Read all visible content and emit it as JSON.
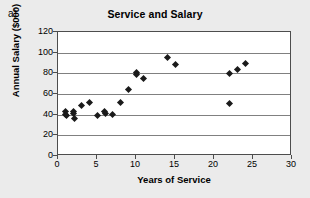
{
  "figure": {
    "panel_label": "a)",
    "background_color": "#ebebeb",
    "plot_background_color": "#ffffff",
    "axis_color": "#4d4d4d",
    "grid_color": "#808080",
    "marker_color": "#1a1a1a"
  },
  "chart_data": {
    "type": "scatter",
    "title": "Service and Salary",
    "xlabel": "Years of Service",
    "ylabel": "Annual Salary ($000)",
    "xlim": [
      0,
      30
    ],
    "ylim": [
      0,
      120
    ],
    "xticks": [
      0,
      5,
      10,
      15,
      20,
      25,
      30
    ],
    "yticks": [
      0,
      20,
      40,
      60,
      80,
      100,
      120
    ],
    "xtick_labels": [
      "0",
      "5",
      "10",
      "15",
      "20",
      "25",
      "30"
    ],
    "ytick_labels": [
      "0",
      "20",
      "40",
      "60",
      "80",
      "100",
      "120"
    ],
    "grid": "horizontal",
    "legend": null,
    "marker": "diamond",
    "points": [
      {
        "x": 1.0,
        "y": 43
      },
      {
        "x": 1.0,
        "y": 40
      },
      {
        "x": 1.1,
        "y": 39
      },
      {
        "x": 2.0,
        "y": 43
      },
      {
        "x": 2.0,
        "y": 41
      },
      {
        "x": 2.1,
        "y": 36
      },
      {
        "x": 3.0,
        "y": 49
      },
      {
        "x": 4.0,
        "y": 52
      },
      {
        "x": 5.0,
        "y": 39
      },
      {
        "x": 6.0,
        "y": 43
      },
      {
        "x": 6.1,
        "y": 41
      },
      {
        "x": 7.0,
        "y": 40
      },
      {
        "x": 8.0,
        "y": 52
      },
      {
        "x": 9.0,
        "y": 64
      },
      {
        "x": 10.0,
        "y": 81
      },
      {
        "x": 10.0,
        "y": 79
      },
      {
        "x": 11.0,
        "y": 75
      },
      {
        "x": 14.0,
        "y": 95
      },
      {
        "x": 15.0,
        "y": 89
      },
      {
        "x": 22.0,
        "y": 51
      },
      {
        "x": 22.0,
        "y": 80
      },
      {
        "x": 23.0,
        "y": 84
      },
      {
        "x": 24.0,
        "y": 90
      }
    ]
  }
}
